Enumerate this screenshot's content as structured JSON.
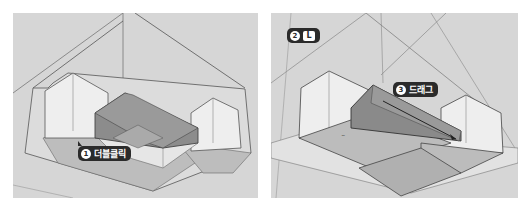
{
  "panels": [
    {
      "id": "panel1",
      "step": "1",
      "callouts": [
        {
          "num": "1",
          "text": "더블클릭",
          "action": "double-click"
        }
      ]
    },
    {
      "id": "panel2",
      "callouts": [
        {
          "num": "2",
          "key": "L",
          "action": "line-tool-shortcut"
        },
        {
          "num": "3",
          "text": "드래그",
          "action": "drag"
        }
      ]
    }
  ],
  "colors": {
    "background": "#d6d6d6",
    "face_light": "#eeeeee",
    "face_mid": "#b4b4b4",
    "face_dark": "#8a8a8a",
    "edge": "#555555",
    "callout_bg": "#2b2b2b"
  }
}
